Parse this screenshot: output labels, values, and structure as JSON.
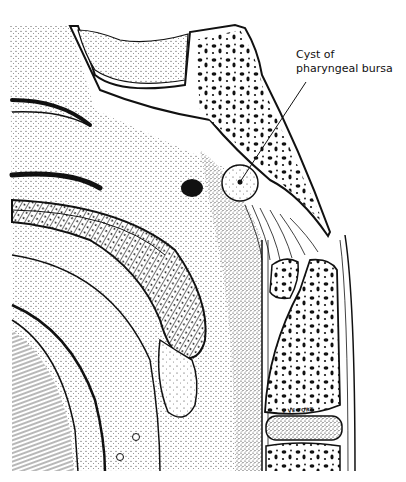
{
  "figure": {
    "type": "anatomical-illustration",
    "style": "stippled pen-and-ink, black on white",
    "colors": {
      "ink": "#111111",
      "paper": "#ffffff"
    }
  },
  "labels": {
    "cyst": {
      "line1": "Cyst of",
      "line2": "pharyngeal bursa"
    }
  },
  "signature": "v VE FORT"
}
